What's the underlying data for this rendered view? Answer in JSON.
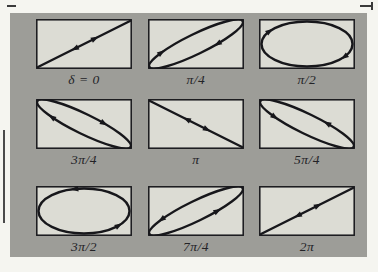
{
  "figure": {
    "panels": [
      {
        "id": "delta-0",
        "label": "δ = 0",
        "shape": "line",
        "tilt": "ascending",
        "motion": "bidirectional"
      },
      {
        "id": "pi-4",
        "label": "π/4",
        "shape": "ellipse-narrow",
        "tilt": "ascending",
        "motion": "clockwise"
      },
      {
        "id": "pi-2",
        "label": "π/2",
        "shape": "ellipse-wide",
        "tilt": "none",
        "motion": "clockwise"
      },
      {
        "id": "3pi-4",
        "label": "3π/4",
        "shape": "ellipse-narrow",
        "tilt": "descending",
        "motion": "clockwise"
      },
      {
        "id": "pi",
        "label": "π",
        "shape": "line",
        "tilt": "descending",
        "motion": "bidirectional"
      },
      {
        "id": "5pi-4",
        "label": "5π/4",
        "shape": "ellipse-narrow",
        "tilt": "descending",
        "motion": "counterclockwise"
      },
      {
        "id": "3pi-2",
        "label": "3π/2",
        "shape": "ellipse-wide",
        "tilt": "none",
        "motion": "counterclockwise"
      },
      {
        "id": "7pi-4",
        "label": "7π/4",
        "shape": "ellipse-narrow",
        "tilt": "ascending",
        "motion": "counterclockwise"
      },
      {
        "id": "2pi",
        "label": "2π",
        "shape": "line",
        "tilt": "ascending",
        "motion": "bidirectional"
      }
    ],
    "colors": {
      "page_background": "#f5f5f0",
      "figure_background": "#9d9d98",
      "panel_fill": "#dcdcd4",
      "ink": "#17171b",
      "label_text": "#232327"
    }
  }
}
